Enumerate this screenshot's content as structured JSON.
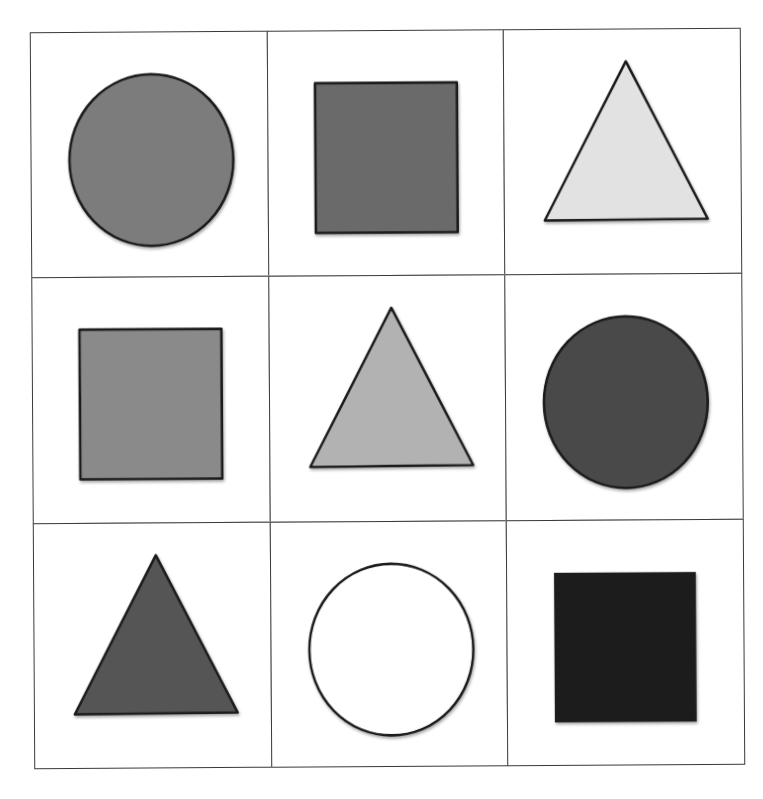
{
  "diagram": {
    "rows": 3,
    "cols": 3,
    "stroke_color": "#1a1a1a",
    "grid_line_color": "#3a3a3a",
    "cells": [
      {
        "row": 0,
        "col": 0,
        "shape": "circle",
        "fill": "#7c7c7c",
        "label": "gray circle"
      },
      {
        "row": 0,
        "col": 1,
        "shape": "square",
        "fill": "#6a6a6a",
        "label": "dark gray square"
      },
      {
        "row": 0,
        "col": 2,
        "shape": "triangle",
        "fill": "#e2e2e2",
        "label": "light gray triangle"
      },
      {
        "row": 1,
        "col": 0,
        "shape": "square",
        "fill": "#8a8a8a",
        "label": "gray square"
      },
      {
        "row": 1,
        "col": 1,
        "shape": "triangle",
        "fill": "#b2b2b2",
        "label": "light gray triangle"
      },
      {
        "row": 1,
        "col": 2,
        "shape": "circle",
        "fill": "#4a4a4a",
        "label": "dark gray circle"
      },
      {
        "row": 2,
        "col": 0,
        "shape": "triangle",
        "fill": "#555555",
        "label": "dark gray triangle"
      },
      {
        "row": 2,
        "col": 1,
        "shape": "circle",
        "fill": "#ffffff",
        "label": "white circle"
      },
      {
        "row": 2,
        "col": 2,
        "shape": "square",
        "fill": "#1e1e1e",
        "label": "black square"
      }
    ]
  }
}
